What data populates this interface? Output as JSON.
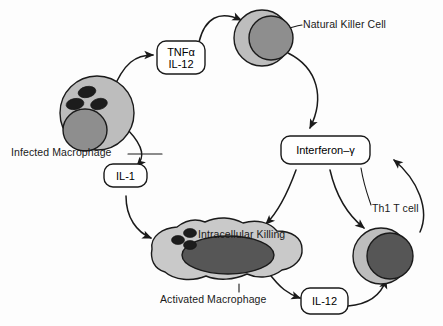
{
  "diagram": {
    "colors": {
      "cytoplasm_light": "#bdbdbd",
      "cytoplasm_amoeboid": "#c9c9c9",
      "nucleus_mid": "#8e8e8e",
      "nucleus_dark": "#565656",
      "granule": "#1c1c1c",
      "stroke": "#1a1a1a",
      "background": "#fdfdfd"
    },
    "cells": [
      {
        "id": "infected-macrophage",
        "label": "Infected Macrophage",
        "shape": "circle",
        "granule_count": 3
      },
      {
        "id": "natural-killer-cell",
        "label": "Natural Killer Cell",
        "shape": "circle",
        "granule_count": 0
      },
      {
        "id": "activated-macrophage",
        "label": "Activated Macrophage",
        "shape": "amoeboid",
        "granule_count": 3,
        "inner_label": "Intracellular Killing"
      },
      {
        "id": "th1-t-cell",
        "label": "Th1 T cell",
        "shape": "circle",
        "granule_count": 0
      }
    ],
    "cytokine_boxes": [
      {
        "id": "tnfa-il12",
        "lines": [
          "TNFα",
          "IL-12"
        ]
      },
      {
        "id": "il1",
        "lines": [
          "IL-1"
        ]
      },
      {
        "id": "interferon-gamma",
        "lines": [
          "Interferon–γ"
        ]
      },
      {
        "id": "il12",
        "lines": [
          "IL-12"
        ]
      }
    ],
    "arrows": [
      {
        "from": "infected-macrophage",
        "to": "tnfa-il12"
      },
      {
        "from": "tnfa-il12",
        "to": "natural-killer-cell"
      },
      {
        "from": "natural-killer-cell",
        "to": "interferon-gamma"
      },
      {
        "from": "infected-macrophage",
        "to": "il1"
      },
      {
        "from": "il1",
        "to": "activated-macrophage"
      },
      {
        "from": "interferon-gamma",
        "to": "activated-macrophage"
      },
      {
        "from": "interferon-gamma",
        "to": "th1-t-cell"
      },
      {
        "from": "activated-macrophage",
        "to": "il12"
      },
      {
        "from": "il12",
        "to": "th1-t-cell"
      },
      {
        "from": "th1-t-cell",
        "to": "interferon-gamma"
      }
    ]
  },
  "labels": {
    "infected_macrophage": "Infected Macrophage",
    "natural_killer_cell": "Natural Killer Cell",
    "activated_macrophage": "Activated Macrophage",
    "intracellular_killing": "Intracellular Killing",
    "th1_t_cell": "Th1 T cell",
    "tnfa": "TNFα",
    "il12_top": "IL-12",
    "il1": "IL-1",
    "interferon_gamma": "Interferon–γ",
    "il12_bottom": "IL-12"
  }
}
